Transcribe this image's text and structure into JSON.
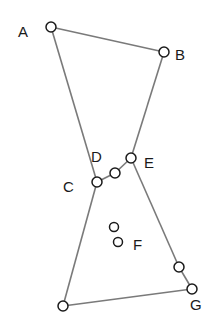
{
  "diagram": {
    "type": "bowtie-polygon",
    "stroke_color": "#7a7a7a",
    "point_stroke": "#1a1a1a",
    "labels": {
      "A": "A",
      "B": "B",
      "C": "C",
      "D": "D",
      "E": "E",
      "F": "F",
      "G": "G"
    },
    "points": [
      {
        "id": "A",
        "x": 51,
        "y": 27
      },
      {
        "id": "B",
        "x": 164,
        "y": 52
      },
      {
        "id": "C",
        "x": 97,
        "y": 182
      },
      {
        "id": "M",
        "x": 115,
        "y": 173
      },
      {
        "id": "E",
        "x": 131,
        "y": 158
      },
      {
        "id": "F1",
        "x": 114,
        "y": 227
      },
      {
        "id": "F2",
        "x": 118,
        "y": 242
      },
      {
        "id": "H",
        "x": 63,
        "y": 306
      },
      {
        "id": "I",
        "x": 179,
        "y": 267
      },
      {
        "id": "G",
        "x": 192,
        "y": 289
      }
    ]
  }
}
